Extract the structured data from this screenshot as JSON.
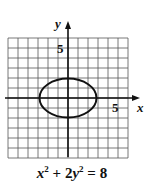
{
  "chart_data": {
    "type": "line",
    "title": "",
    "equation": {
      "x_var": "x",
      "x_exp": "2",
      "plus": " + ",
      "coef": "2",
      "y_var": "y",
      "y_exp": "2",
      "rhs": " = 8"
    },
    "caption": "x^2 + 2y^2 = 8",
    "curve": {
      "shape": "ellipse",
      "center": [
        0,
        0
      ],
      "rx": 2.828,
      "ry": 2.0
    },
    "series": [
      {
        "name": "x^2 + 2y^2 = 8",
        "points": [
          [
            2.83,
            0
          ],
          [
            2,
            1.41
          ],
          [
            0,
            2
          ],
          [
            -2,
            1.41
          ],
          [
            -2.83,
            0
          ],
          [
            -2,
            -1.41
          ],
          [
            0,
            -2
          ],
          [
            2,
            -1.41
          ]
        ]
      }
    ],
    "xlabel": "x",
    "ylabel": "y",
    "x_tick_label": "5",
    "y_tick_label": "5",
    "xlim": [
      -6,
      6
    ],
    "ylim": [
      -6,
      6
    ],
    "grid": true,
    "grid_step": 1,
    "legend": "none"
  }
}
